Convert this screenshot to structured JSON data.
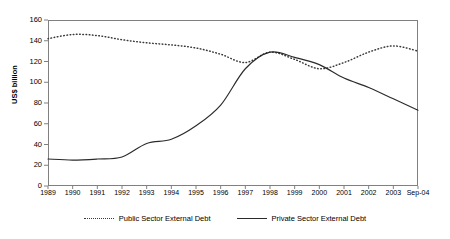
{
  "chart_data": {
    "type": "line",
    "title": "",
    "xlabel": "",
    "ylabel": "US$ billion",
    "ylim": [
      0,
      160
    ],
    "ytick_step": 20,
    "yticks": [
      0,
      20,
      40,
      60,
      80,
      100,
      120,
      140,
      160
    ],
    "grid": false,
    "legend_position": "bottom-center",
    "categories": [
      "1989",
      "1990",
      "1991",
      "1992",
      "1993",
      "1994",
      "1995",
      "1996",
      "1997",
      "1998",
      "1999",
      "2000",
      "2001",
      "2002",
      "2003",
      "Sep-04"
    ],
    "series": [
      {
        "name": "Public Sector External Debt",
        "style": "dotted",
        "color": "#3a3a3a",
        "values": [
          142,
          146,
          145,
          141,
          138,
          136,
          133,
          127,
          119,
          129,
          122,
          113,
          119,
          129,
          135,
          130
        ]
      },
      {
        "name": "Private Sector External Debt",
        "style": "solid",
        "color": "#2b2b2b",
        "values": [
          26,
          25,
          26,
          28,
          41,
          45,
          58,
          78,
          113,
          129,
          124,
          117,
          104,
          95,
          84,
          73
        ]
      }
    ]
  },
  "axis": {
    "y_title": "US$ billion",
    "y_labels": [
      "160",
      "140",
      "120",
      "100",
      "80",
      "60",
      "40",
      "20",
      "0"
    ],
    "x_labels": [
      "1989",
      "1990",
      "1991",
      "1992",
      "1993",
      "1994",
      "1995",
      "1996",
      "1997",
      "1998",
      "1999",
      "2000",
      "2001",
      "2002",
      "2003",
      "Sep-04"
    ]
  },
  "legend": {
    "items": [
      {
        "label": "Public Sector External Debt",
        "marker": "dotted-line-swatch"
      },
      {
        "label": "Private Sector External Debt",
        "marker": "solid-line-swatch"
      }
    ]
  }
}
